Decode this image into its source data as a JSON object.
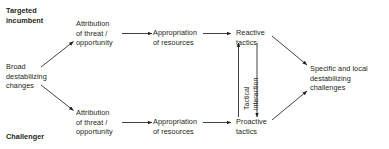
{
  "diagram": {
    "type": "flow-diagram",
    "background_color": "#ffffff",
    "text_color": "#231f20",
    "line_color": "#231f20",
    "actor_labels": {
      "top": "Targeted\nincumbent",
      "bottom": "Challenger"
    },
    "nodes": {
      "source": "Broad\ndestabilizing\nchanges",
      "top_attribution": "Attribution\nof threat /\nopportunity",
      "top_appropriation": "Appropriation\nof resources",
      "top_tactics": "Reactive\ntactics",
      "bottom_attribution": "Attribution\nof threat /\nopportunity",
      "bottom_appropriation": "Appropriation\nof resources",
      "bottom_tactics": "Proactive\ntactics",
      "outcome": "Specific and local\ndestabilizing\nchallenges"
    },
    "interaction_label": "Tactical\ninteraction"
  }
}
